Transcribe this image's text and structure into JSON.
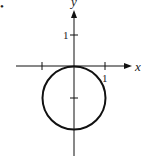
{
  "diagram": {
    "type": "graph",
    "x_axis_label": "x",
    "y_axis_label": "y",
    "x_tick_label": "1",
    "y_tick_label": "1",
    "bullet": "•",
    "circle": {
      "center": [
        0,
        -1
      ],
      "radius": 1
    },
    "colors": {
      "stroke": "#111111",
      "background": "#ffffff"
    }
  }
}
